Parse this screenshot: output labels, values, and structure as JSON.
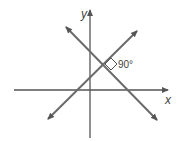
{
  "diagram": {
    "type": "coordinate-plane",
    "axes": {
      "x_label": "x",
      "y_label": "y"
    },
    "lines": [
      {
        "name": "line-decreasing",
        "slope": "negative",
        "arrows": "both ends"
      },
      {
        "name": "line-increasing",
        "slope": "positive",
        "arrows": "both ends"
      }
    ],
    "intersection": {
      "right_angle_marker": true,
      "angle_label": "90°"
    },
    "colors": {
      "axis": "#555555",
      "lines": "#6b6b6b",
      "background": "#ffffff"
    }
  }
}
